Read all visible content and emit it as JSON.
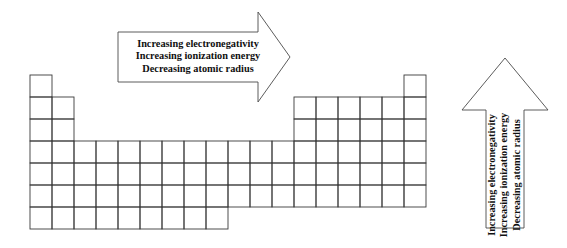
{
  "figure": {
    "background_color": "#ffffff",
    "line_color": "#3a3a3a"
  },
  "periodic_table": {
    "name": "periodic-table-outline",
    "columns": 18,
    "periods": 7,
    "cell_width": 22.0,
    "cell_height": 22.0,
    "origin_x": 30,
    "origin_y": 75,
    "row_spans": [
      {
        "period": 1,
        "segments": [
          [
            1,
            1
          ],
          [
            18,
            18
          ]
        ]
      },
      {
        "period": 2,
        "segments": [
          [
            1,
            2
          ],
          [
            13,
            18
          ]
        ]
      },
      {
        "period": 3,
        "segments": [
          [
            1,
            2
          ],
          [
            13,
            18
          ]
        ]
      },
      {
        "period": 4,
        "segments": [
          [
            1,
            18
          ]
        ]
      },
      {
        "period": 5,
        "segments": [
          [
            1,
            18
          ]
        ]
      },
      {
        "period": 6,
        "segments": [
          [
            1,
            18
          ]
        ]
      },
      {
        "period": 7,
        "segments": [
          [
            1,
            9
          ]
        ]
      }
    ]
  },
  "horizontal_arrow": {
    "name": "horizontal-trend-arrow",
    "direction": "right",
    "body": {
      "x": 118,
      "y": 32,
      "width": 140,
      "height": 50
    },
    "head": {
      "tip_x": 290,
      "top_y": 12,
      "bottom_y": 102
    },
    "lines": [
      "Increasing electronegativity",
      "Increasing ionization energy",
      "Decreasing atomic radius"
    ]
  },
  "vertical_arrow": {
    "name": "vertical-trend-arrow",
    "direction": "up",
    "body": {
      "x": 486,
      "y": 110,
      "width": 38,
      "height": 118
    },
    "head": {
      "tip_y": 58,
      "left_x": 462,
      "right_x": 548
    },
    "lines": [
      "Increasing electronegativity",
      "Increasing ionization energy",
      "Decreasing atomic radius"
    ]
  }
}
